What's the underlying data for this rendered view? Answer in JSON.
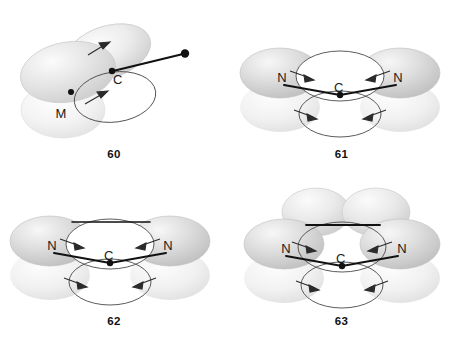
{
  "figure": {
    "type": "orbital-hybridization-diagram-set",
    "panel_count": 4
  },
  "panels": [
    {
      "id": "60",
      "caption": "60",
      "center_atom": "C",
      "labels": [
        {
          "text": "C",
          "role": "central-atom"
        },
        {
          "text": "M",
          "role": "substituent-atom"
        }
      ],
      "lobes": [
        {
          "name": "upper-right-lobe",
          "shade": "light",
          "tilt": -20
        },
        {
          "name": "left-large-lobe",
          "shade": "light",
          "tilt": -12
        },
        {
          "name": "lower-left-lobe",
          "shade": "pale",
          "tilt": 0
        }
      ],
      "bonds": [
        {
          "name": "sigma-bond-to-terminal",
          "style": "solid-line-with-dot-terminus"
        }
      ],
      "arrows": [
        {
          "name": "upper-arrow",
          "direction": "up-right"
        },
        {
          "name": "lower-arrow",
          "direction": "up-right"
        }
      ],
      "rings": [
        {
          "name": "lower-ring-orbital"
        }
      ]
    },
    {
      "id": "61",
      "caption": "61",
      "center_atom": "C",
      "labels": [
        {
          "text": "N",
          "role": "left-atom"
        },
        {
          "text": "C",
          "role": "central-atom"
        },
        {
          "text": "N",
          "role": "right-atom"
        }
      ],
      "lobes": [
        {
          "name": "left-lobe-upper",
          "shade": "medium"
        },
        {
          "name": "right-lobe-upper",
          "shade": "medium"
        },
        {
          "name": "left-lobe-lower",
          "shade": "pale"
        },
        {
          "name": "right-lobe-lower",
          "shade": "pale"
        }
      ],
      "bonds": [
        {
          "name": "sigma-bond-left",
          "style": "solid-line"
        },
        {
          "name": "sigma-bond-right",
          "style": "solid-line"
        }
      ],
      "arrows": [
        {
          "name": "arrow-upper-left",
          "direction": "inward-right"
        },
        {
          "name": "arrow-upper-right",
          "direction": "inward-left"
        },
        {
          "name": "arrow-lower-left",
          "direction": "inward-right"
        },
        {
          "name": "arrow-lower-right",
          "direction": "inward-left"
        }
      ],
      "rings": [
        {
          "name": "upper-ring-orbital"
        },
        {
          "name": "lower-ring-orbital"
        }
      ]
    },
    {
      "id": "62",
      "caption": "62",
      "center_atom": "C",
      "labels": [
        {
          "text": "N",
          "role": "left-atom"
        },
        {
          "text": "C",
          "role": "central-atom"
        },
        {
          "text": "N",
          "role": "right-atom"
        }
      ],
      "lobes": [
        {
          "name": "left-lobe-upper",
          "shade": "medium"
        },
        {
          "name": "right-lobe-upper",
          "shade": "medium"
        },
        {
          "name": "left-lobe-lower",
          "shade": "pale"
        },
        {
          "name": "right-lobe-lower",
          "shade": "pale"
        }
      ],
      "bonds": [
        {
          "name": "top-horizontal-bond",
          "style": "solid-line"
        },
        {
          "name": "sigma-bond-left",
          "style": "solid-line"
        },
        {
          "name": "sigma-bond-right",
          "style": "solid-line"
        }
      ],
      "arrows": [
        {
          "name": "arrow-upper-left",
          "direction": "inward-right"
        },
        {
          "name": "arrow-upper-right",
          "direction": "inward-left"
        },
        {
          "name": "arrow-lower-left",
          "direction": "inward-right"
        },
        {
          "name": "arrow-lower-right",
          "direction": "inward-left"
        }
      ],
      "rings": [
        {
          "name": "upper-ring-orbital"
        },
        {
          "name": "lower-ring-orbital"
        }
      ]
    },
    {
      "id": "63",
      "caption": "63",
      "center_atom": "C",
      "labels": [
        {
          "text": "N",
          "role": "left-atom"
        },
        {
          "text": "C",
          "role": "central-atom"
        },
        {
          "text": "N",
          "role": "right-atom"
        }
      ],
      "lobes": [
        {
          "name": "top-left-lobe",
          "shade": "light"
        },
        {
          "name": "top-right-lobe",
          "shade": "light"
        },
        {
          "name": "left-lobe-upper",
          "shade": "medium"
        },
        {
          "name": "right-lobe-upper",
          "shade": "medium"
        },
        {
          "name": "left-lobe-lower",
          "shade": "pale"
        },
        {
          "name": "right-lobe-lower",
          "shade": "pale"
        }
      ],
      "bonds": [
        {
          "name": "top-horizontal-bond",
          "style": "solid-line"
        },
        {
          "name": "sigma-bond-left",
          "style": "solid-line"
        },
        {
          "name": "sigma-bond-right",
          "style": "solid-line"
        }
      ],
      "arrows": [
        {
          "name": "arrow-upper-left",
          "direction": "inward-right"
        },
        {
          "name": "arrow-upper-right",
          "direction": "inward-left"
        },
        {
          "name": "arrow-lower-left",
          "direction": "inward-right"
        },
        {
          "name": "arrow-lower-right",
          "direction": "inward-left"
        }
      ],
      "rings": [
        {
          "name": "upper-ring-orbital"
        },
        {
          "name": "lower-ring-orbital"
        }
      ]
    }
  ],
  "colors": {
    "background": "#ffffff",
    "stroke": "#1a1a1a",
    "lobe_light": "#e8e8e8",
    "lobe_medium": "#d6d6d6",
    "lobe_pale": "#f0f0f0",
    "text": "#111111"
  }
}
